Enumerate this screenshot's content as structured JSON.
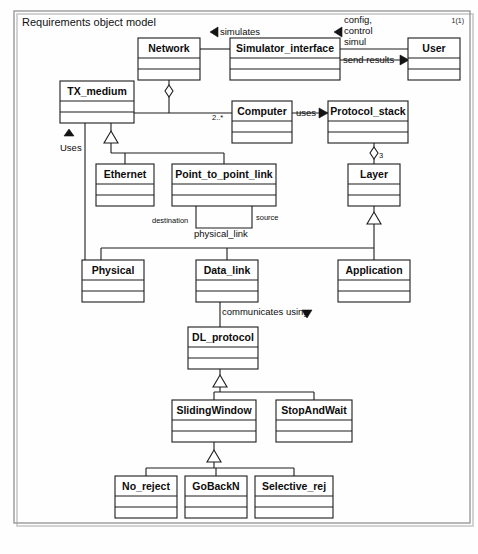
{
  "diagram": {
    "title": "Requirements object model",
    "page_number": "1(1)",
    "type": "uml-class-diagram",
    "classes": [
      {
        "id": "network",
        "name": "Network",
        "x": 138,
        "y": 38,
        "w": 62,
        "h": 42
      },
      {
        "id": "simulator_interface",
        "name": "Simulator_interface",
        "x": 230,
        "y": 38,
        "w": 110,
        "h": 42
      },
      {
        "id": "user",
        "name": "User",
        "x": 408,
        "y": 38,
        "w": 52,
        "h": 42
      },
      {
        "id": "tx_medium",
        "name": "TX_medium",
        "x": 60,
        "y": 81,
        "w": 74,
        "h": 42
      },
      {
        "id": "computer",
        "name": "Computer",
        "x": 232,
        "y": 101,
        "w": 60,
        "h": 42
      },
      {
        "id": "protocol_stack",
        "name": "Protocol_stack",
        "x": 328,
        "y": 101,
        "w": 80,
        "h": 42
      },
      {
        "id": "ethernet",
        "name": "Ethernet",
        "x": 96,
        "y": 164,
        "w": 58,
        "h": 42
      },
      {
        "id": "point_to_point",
        "name": "Point_to_point_link",
        "x": 172,
        "y": 164,
        "w": 104,
        "h": 42
      },
      {
        "id": "layer",
        "name": "Layer",
        "x": 348,
        "y": 164,
        "w": 52,
        "h": 42
      },
      {
        "id": "physical",
        "name": "Physical",
        "x": 82,
        "y": 260,
        "w": 62,
        "h": 42
      },
      {
        "id": "data_link",
        "name": "Data_link",
        "x": 196,
        "y": 260,
        "w": 62,
        "h": 42
      },
      {
        "id": "application",
        "name": "Application",
        "x": 338,
        "y": 260,
        "w": 72,
        "h": 42
      },
      {
        "id": "dl_protocol",
        "name": "DL_protocol",
        "x": 188,
        "y": 327,
        "w": 70,
        "h": 42
      },
      {
        "id": "sliding_window",
        "name": "SlidingWindow",
        "x": 172,
        "y": 400,
        "w": 84,
        "h": 42
      },
      {
        "id": "stop_and_wait",
        "name": "StopAndWait",
        "x": 276,
        "y": 400,
        "w": 76,
        "h": 42
      },
      {
        "id": "no_reject",
        "name": "No_reject",
        "x": 115,
        "y": 476,
        "w": 62,
        "h": 42
      },
      {
        "id": "go_back_n",
        "name": "GoBackN",
        "x": 185,
        "y": 476,
        "w": 62,
        "h": 42
      },
      {
        "id": "selective_rej",
        "name": "Selective_rej",
        "x": 255,
        "y": 476,
        "w": 78,
        "h": 42
      }
    ],
    "edge_labels": [
      {
        "id": "simulates",
        "text": "simulates",
        "x": 220,
        "y": 32,
        "anchor": "start"
      },
      {
        "id": "config-control",
        "text": "config,",
        "x": 344,
        "y": 20,
        "anchor": "start"
      },
      {
        "id": "config-control-2",
        "text": "control",
        "x": 344,
        "y": 31,
        "anchor": "start"
      },
      {
        "id": "config-control-3",
        "text": "simul",
        "x": 344,
        "y": 42,
        "anchor": "start"
      },
      {
        "id": "send-results",
        "text": "send results",
        "x": 343,
        "y": 60,
        "anchor": "start"
      },
      {
        "id": "uses-tx",
        "text": "Uses",
        "x": 62,
        "y": 148,
        "anchor": "start"
      },
      {
        "id": "multiplicity-2star",
        "text": "2..*",
        "x": 212,
        "y": 118,
        "anchor": "start"
      },
      {
        "id": "uses-protocol",
        "text": "uses",
        "x": 298,
        "y": 113,
        "anchor": "start"
      },
      {
        "id": "multiplicity-3",
        "text": "3",
        "x": 378,
        "y": 155,
        "anchor": "start"
      },
      {
        "id": "destination",
        "text": "destination",
        "x": 155,
        "y": 221,
        "anchor": "start"
      },
      {
        "id": "source",
        "text": "source",
        "x": 256,
        "y": 218,
        "anchor": "start"
      },
      {
        "id": "physical-link",
        "text": "physical_link",
        "x": 196,
        "y": 233,
        "anchor": "start"
      },
      {
        "id": "communicates-using",
        "text": "communicates using",
        "x": 222,
        "y": 312,
        "anchor": "start"
      }
    ]
  },
  "colors": {
    "box_fill": "#ffffff",
    "stroke": "#1c1c1c",
    "frame": "#9a9a9a",
    "text": "#0d0d0d",
    "page_bg": "#fefefe"
  }
}
